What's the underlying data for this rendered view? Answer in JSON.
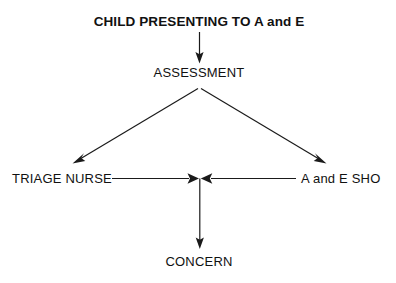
{
  "diagram": {
    "type": "flowchart",
    "background_color": "#ffffff",
    "line_color": "#1a1a1a",
    "text_color": "#111111",
    "nodes": [
      {
        "id": "child_presenting",
        "label": "CHILD PRESENTING TO A and E",
        "bold": true,
        "x": 199,
        "y": 22
      },
      {
        "id": "assessment",
        "label": "ASSESSMENT",
        "bold": false,
        "x": 199,
        "y": 73
      },
      {
        "id": "triage_nurse",
        "label": "TRIAGE NURSE",
        "bold": false,
        "x": 62,
        "y": 179
      },
      {
        "id": "a_and_e_sho",
        "label": "A and E SHO",
        "bold": false,
        "x": 340,
        "y": 179
      },
      {
        "id": "concern",
        "label": "CONCERN",
        "bold": false,
        "x": 199,
        "y": 262
      }
    ],
    "edges": [
      {
        "id": "child-to-assessment",
        "from": "child_presenting",
        "to": "assessment",
        "direction": "down",
        "arrowhead": "end"
      },
      {
        "id": "assessment-to-triage",
        "from": "assessment",
        "to": "triage_nurse",
        "direction": "down-left",
        "arrowhead": "end"
      },
      {
        "id": "assessment-to-sho",
        "from": "assessment",
        "to": "a_and_e_sho",
        "direction": "down-right",
        "arrowhead": "end"
      },
      {
        "id": "triage-to-junction",
        "from": "triage_nurse",
        "to": "junction",
        "direction": "right",
        "arrowhead": "end"
      },
      {
        "id": "sho-to-junction",
        "from": "a_and_e_sho",
        "to": "junction",
        "direction": "left",
        "arrowhead": "end"
      },
      {
        "id": "junction-to-concern",
        "from": "junction",
        "to": "concern",
        "direction": "down",
        "arrowhead": "end"
      }
    ]
  }
}
